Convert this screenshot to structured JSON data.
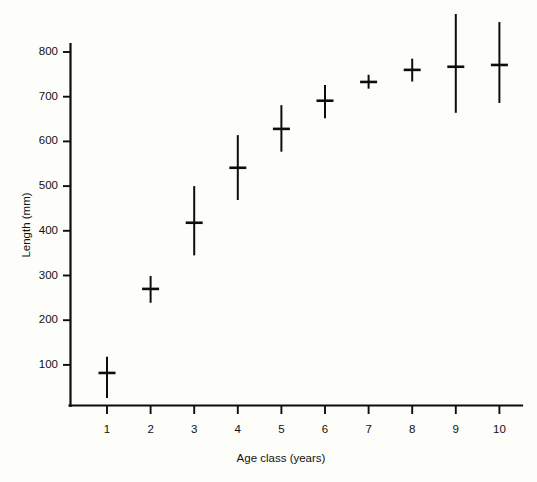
{
  "chart_data": {
    "type": "scatter",
    "title": "",
    "subtitle": "",
    "xlabel": "Age class (years)",
    "ylabel": "Length (mm)",
    "grid": false,
    "legend": "none",
    "xlim": [
      0.4,
      10.6
    ],
    "ylim": [
      0,
      900
    ],
    "x_ticks": [
      1,
      2,
      3,
      4,
      5,
      6,
      7,
      8,
      9,
      10
    ],
    "x_tick_labels": [
      "1",
      "2",
      "3",
      "4",
      "5",
      "6",
      "7",
      "8",
      "9",
      "10"
    ],
    "y_ticks": [
      100,
      200,
      300,
      400,
      500,
      600,
      700,
      800
    ],
    "y_tick_labels": [
      "100",
      "200",
      "300",
      "400",
      "500",
      "600",
      "700",
      "800"
    ],
    "marker": "horizontal-bar-with-vertical-range",
    "categories": [
      "1",
      "2",
      "3",
      "4",
      "5",
      "6",
      "7",
      "8",
      "9",
      "10"
    ],
    "x": [
      1,
      2,
      3,
      4,
      5,
      6,
      7,
      8,
      9,
      10
    ],
    "values": [
      82,
      270,
      418,
      541,
      628,
      691,
      733,
      760,
      767,
      771
    ],
    "range_low": [
      26,
      239,
      345,
      469,
      577,
      652,
      718,
      734,
      664,
      686
    ],
    "range_high": [
      118,
      299,
      500,
      614,
      681,
      726,
      749,
      785,
      885,
      867
    ],
    "series": [
      {
        "name": "Mean length",
        "values": [
          82,
          270,
          418,
          541,
          628,
          691,
          733,
          760,
          767,
          771
        ]
      }
    ],
    "points": [
      {
        "age_class": 1,
        "mean": 82,
        "low": 26,
        "high": 118
      },
      {
        "age_class": 2,
        "mean": 270,
        "low": 239,
        "high": 299
      },
      {
        "age_class": 3,
        "mean": 418,
        "low": 345,
        "high": 500
      },
      {
        "age_class": 4,
        "mean": 541,
        "low": 469,
        "high": 614
      },
      {
        "age_class": 5,
        "mean": 628,
        "low": 577,
        "high": 681
      },
      {
        "age_class": 6,
        "mean": 691,
        "low": 652,
        "high": 726
      },
      {
        "age_class": 7,
        "mean": 733,
        "low": 718,
        "high": 749
      },
      {
        "age_class": 8,
        "mean": 760,
        "low": 734,
        "high": 785
      },
      {
        "age_class": 9,
        "mean": 767,
        "low": 664,
        "high": 885
      },
      {
        "age_class": 10,
        "mean": 771,
        "low": 686,
        "high": 867
      }
    ],
    "colors": {
      "ink": "#0d0d0d",
      "background": "#fdfdfa"
    }
  }
}
